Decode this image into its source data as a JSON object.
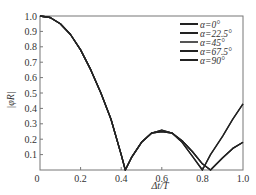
{
  "chart_data": {
    "type": "line",
    "title": "",
    "xlabel": "Δt/T",
    "ylabel": "|φ_R|",
    "xlim": [
      0,
      1.0
    ],
    "ylim": [
      0,
      1.0
    ],
    "grid": false,
    "legend_position": "top-right",
    "x_ticks": [
      "0",
      "0.2",
      "0.4",
      "0.6",
      "0.8",
      "1.0"
    ],
    "y_ticks": [
      "0.1",
      "0.2",
      "0.3",
      "0.4",
      "0.5",
      "0.6",
      "0.7",
      "0.8",
      "0.9",
      "1.0"
    ],
    "x": [
      0,
      0.05,
      0.1,
      0.15,
      0.2,
      0.25,
      0.3,
      0.35,
      0.4,
      0.42,
      0.45,
      0.5,
      0.55,
      0.6,
      0.65,
      0.7,
      0.75,
      0.8,
      0.84,
      0.9,
      0.95,
      1.0
    ],
    "series": [
      {
        "name": "α=0°",
        "color": "#222222",
        "values": [
          1.0,
          0.99,
          0.95,
          0.88,
          0.78,
          0.65,
          0.5,
          0.33,
          0.1,
          0.0,
          0.08,
          0.18,
          0.24,
          0.26,
          0.24,
          0.18,
          0.09,
          0.0,
          0.1,
          0.22,
          0.33,
          0.43
        ]
      },
      {
        "name": "α=22.5°",
        "color": "#222222",
        "values": [
          1.0,
          0.99,
          0.95,
          0.88,
          0.78,
          0.65,
          0.5,
          0.33,
          0.1,
          0.0,
          0.08,
          0.18,
          0.24,
          0.26,
          0.24,
          0.18,
          0.09,
          0.0,
          0.1,
          0.22,
          0.33,
          0.43
        ]
      },
      {
        "name": "α=45°",
        "color": "#555555",
        "values": [
          1.0,
          0.99,
          0.95,
          0.88,
          0.78,
          0.65,
          0.5,
          0.33,
          0.1,
          0.0,
          0.08,
          0.18,
          0.24,
          0.25,
          0.24,
          0.19,
          0.12,
          0.04,
          0.0,
          0.08,
          0.14,
          0.18
        ]
      },
      {
        "name": "α=67.5°",
        "color": "#222222",
        "values": [
          1.0,
          0.99,
          0.95,
          0.88,
          0.78,
          0.65,
          0.5,
          0.33,
          0.1,
          0.0,
          0.08,
          0.18,
          0.24,
          0.25,
          0.24,
          0.19,
          0.12,
          0.04,
          0.0,
          0.08,
          0.14,
          0.18
        ]
      },
      {
        "name": "α=90°",
        "color": "#222222",
        "values": [
          1.0,
          0.99,
          0.95,
          0.88,
          0.78,
          0.65,
          0.5,
          0.33,
          0.1,
          0.0,
          0.08,
          0.18,
          0.24,
          0.25,
          0.24,
          0.19,
          0.12,
          0.04,
          0.0,
          0.08,
          0.14,
          0.18
        ]
      }
    ]
  },
  "labels": {
    "xlabel": "Δt/T",
    "ylabel": "|φR|",
    "origin": "0"
  }
}
